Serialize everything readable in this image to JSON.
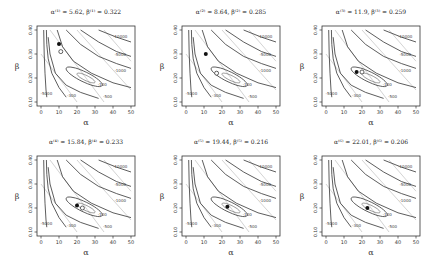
{
  "figure": {
    "panels_layout": "2x3",
    "xlabel": "α",
    "ylabel": "β",
    "xticks": [
      "0",
      "10",
      "20",
      "30",
      "40",
      "50"
    ],
    "yticks": [
      "0.10",
      "0.20",
      "0.30",
      "0.40"
    ]
  },
  "panels": [
    {
      "title": "α⁽¹⁾ = 5.62, β⁽¹⁾ = 0.322",
      "filled": {
        "a": 10,
        "b": 0.342
      },
      "open": {
        "a": 11,
        "b": 0.31
      }
    },
    {
      "title": "α⁽²⁾ = 8.64, β⁽²⁾ = 0.285",
      "filled": {
        "a": 11,
        "b": 0.3
      },
      "open": {
        "a": 17,
        "b": 0.22
      }
    },
    {
      "title": "α⁽³⁾ = 11.9, β⁽³⁾ = 0.259",
      "filled": {
        "a": 17,
        "b": 0.225
      },
      "open": {
        "a": 20,
        "b": 0.225
      }
    },
    {
      "title": "α⁽⁴⁾ = 15.84, β⁽⁴⁾ = 0.233",
      "filled": {
        "a": 20,
        "b": 0.21
      },
      "open": {
        "a": 23,
        "b": 0.2
      }
    },
    {
      "title": "α⁽⁵⁾ = 19.44, β⁽⁵⁾ = 0.216",
      "filled": {
        "a": 23,
        "b": 0.205
      },
      "open": null
    },
    {
      "title": "α⁽⁶⁾ = 22.01, β⁽⁶⁾ = 0.206",
      "filled": {
        "a": 23,
        "b": 0.2
      },
      "open": null
    }
  ],
  "contour_labels": [
    "-100",
    "-300",
    "-500",
    "-1000",
    "-3000",
    "-5000",
    "-10000"
  ],
  "chart_data": {
    "type": "contour",
    "xlabel": "α",
    "ylabel": "β",
    "xlim": [
      0,
      50
    ],
    "ylim": [
      0.1,
      0.4
    ],
    "contour_levels": [
      -100,
      -300,
      -500,
      -1000,
      -3000,
      -5000,
      -10000
    ],
    "series": [
      {
        "name": "iteration 1",
        "alpha": 5.62,
        "beta": 0.322
      },
      {
        "name": "iteration 2",
        "alpha": 8.64,
        "beta": 0.285
      },
      {
        "name": "iteration 3",
        "alpha": 11.9,
        "beta": 0.259
      },
      {
        "name": "iteration 4",
        "alpha": 15.84,
        "beta": 0.233
      },
      {
        "name": "iteration 5",
        "alpha": 19.44,
        "beta": 0.216
      },
      {
        "name": "iteration 6",
        "alpha": 22.01,
        "beta": 0.206
      }
    ],
    "grid": false,
    "legend": "none"
  }
}
